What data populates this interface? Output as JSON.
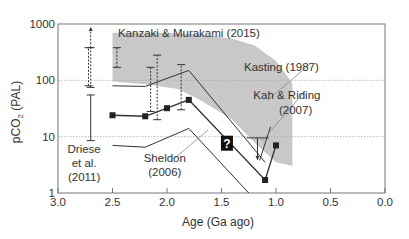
{
  "chart_data": {
    "type": "line",
    "title": "",
    "xlabel": "Age (Ga ago)",
    "ylabel": "pCO2 (PAL)",
    "ylabel_parts": {
      "main": "pCO",
      "sub": "2",
      "unit": " (PAL)"
    },
    "x_reversed": true,
    "xlim": [
      3.0,
      0.0
    ],
    "ylim": [
      1,
      1000
    ],
    "yscale": "log",
    "x_ticks": [
      "3.0",
      "2.5",
      "2.0",
      "1.5",
      "1.0",
      "0.5",
      "0.0"
    ],
    "y_ticks": [
      "1",
      "10",
      "100",
      "1000"
    ],
    "grid": "dotted horizontal at 10 and 100",
    "series": [
      {
        "name": "Sheldon (2006)",
        "marker": "square",
        "x": [
          2.5,
          2.2,
          2.0,
          1.8,
          1.1,
          1.0
        ],
        "y": [
          24,
          23,
          32,
          45,
          1.7,
          7
        ]
      },
      {
        "name": "Kanzaki & Murakami (2015) upper bound",
        "marker": "none",
        "x": [
          2.5,
          2.2,
          1.8,
          1.1
        ],
        "y": [
          80,
          78,
          150,
          3.5
        ]
      },
      {
        "name": "Kanzaki & Murakami (2015) lower bound",
        "marker": "none",
        "x": [
          2.5,
          2.2,
          1.8,
          1.25
        ],
        "y": [
          7,
          6.5,
          14,
          1
        ]
      },
      {
        "name": "Kah & Riding (2007)",
        "marker": "none",
        "x": [
          1.15,
          1.05
        ],
        "y": [
          3.8,
          15
        ]
      }
    ],
    "error_bars": [
      {
        "x": 2.7,
        "low": 8.5,
        "high": 55,
        "style": "solid",
        "group": "Driese et al. (2011)"
      },
      {
        "x": 2.7,
        "low": 75,
        "high": 380,
        "style": "dashed",
        "arrow_up": true,
        "group": "Kanzaki & Murakami (2015)"
      },
      {
        "x": 2.72,
        "low": 80,
        "high": 380,
        "style": "dashed"
      },
      {
        "x": 2.46,
        "low": 170,
        "high": 380,
        "style": "dashed"
      },
      {
        "x": 2.15,
        "low": 28,
        "high": 170,
        "style": "dashed"
      },
      {
        "x": 2.09,
        "low": 20,
        "high": 280,
        "style": "dashed"
      },
      {
        "x": 1.87,
        "low": 30,
        "high": 190,
        "style": "dashed"
      },
      {
        "x": 1.17,
        "low": 9.5,
        "high": 9.5,
        "style": "solid",
        "arrow_down": true,
        "group": "Kah & Riding (2007)"
      }
    ],
    "band": {
      "name": "Kasting (1987)",
      "color": "#c8c8c8",
      "upper": [
        [
          2.5,
          700
        ],
        [
          2.0,
          700
        ],
        [
          1.7,
          650
        ],
        [
          1.4,
          550
        ],
        [
          1.2,
          420
        ],
        [
          1.0,
          220
        ],
        [
          0.85,
          90
        ]
      ],
      "lower": [
        [
          2.5,
          95
        ],
        [
          2.2,
          85
        ],
        [
          1.9,
          70
        ],
        [
          1.7,
          45
        ],
        [
          1.4,
          20
        ],
        [
          1.2,
          8
        ],
        [
          1.0,
          3.5
        ],
        [
          0.85,
          3
        ]
      ]
    },
    "annotations": [
      {
        "text": "Kanzaki & Murakami (2015)",
        "x": 2.45,
        "y": 700
      },
      {
        "text": "Kasting (1987)",
        "x": 0.95,
        "y": 170
      },
      {
        "text": "Kah & Riding",
        "x": 0.9,
        "y": 55
      },
      {
        "text": "(2007)",
        "x": 0.82,
        "y": 30
      },
      {
        "text": "Driese",
        "x": 2.76,
        "y": 6
      },
      {
        "text": "et al.",
        "x": 2.76,
        "y": 3.4
      },
      {
        "text": "(2011)",
        "x": 2.76,
        "y": 1.9
      },
      {
        "text": "Sheldon",
        "x": 2.02,
        "y": 4.2
      },
      {
        "text": "(2006)",
        "x": 2.02,
        "y": 2.4
      },
      {
        "text": "?",
        "x": 1.45,
        "y": 7.5,
        "boxed": true
      }
    ]
  },
  "colors": {
    "band": "#c8c8c8",
    "line": "#333333",
    "grid": "#aaaaaa",
    "frame": "#777777",
    "marker": "#222222"
  }
}
